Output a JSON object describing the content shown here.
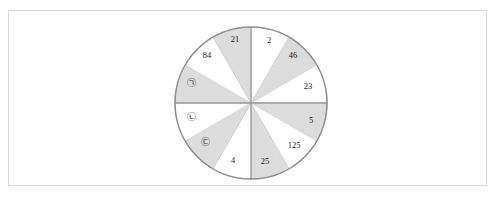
{
  "figure": {
    "type": "circle-sector-diagram",
    "sector_count": 12,
    "sector_angle_degrees": 30,
    "center": {
      "x": 251,
      "y": 103
    },
    "radius": 76,
    "colors": {
      "shaded_fill": "#dcdcdc",
      "white_fill": "#ffffff",
      "outline": "#8e8e8e",
      "axis": "#9a9a9a",
      "frame_border": "#d8d8d8",
      "label_text": "#1c1c1c",
      "background": "#ffffff"
    },
    "axes": [
      {
        "name": "vertical-diameter",
        "orientation": "vertical"
      },
      {
        "name": "horizontal-diameter",
        "orientation": "horizontal"
      }
    ]
  },
  "chart_data": {
    "type": "pie",
    "title": "",
    "xlabel": "",
    "ylabel": "",
    "legend_position": "none",
    "grid": false,
    "note": "Twelve equal 30-degree sectors, alternating white and shaded fill, labelled clockwise from the top.",
    "categories": [
      "2",
      "46",
      "23",
      "5",
      "125",
      "25",
      "4",
      "㉢",
      "㉡",
      "㉠",
      "84",
      "21"
    ],
    "values": [
      30,
      30,
      30,
      30,
      30,
      30,
      30,
      30,
      30,
      30,
      30,
      30
    ],
    "sectors": [
      {
        "index": 0,
        "label": "2",
        "fill": "white",
        "start_deg": 0,
        "end_deg": 30,
        "label_x": 269,
        "label_y": 41,
        "is_marker": false
      },
      {
        "index": 1,
        "label": "46",
        "fill": "shaded",
        "start_deg": 30,
        "end_deg": 60,
        "label_x": 293,
        "label_y": 56,
        "is_marker": false
      },
      {
        "index": 2,
        "label": "23",
        "fill": "white",
        "start_deg": 60,
        "end_deg": 90,
        "label_x": 308,
        "label_y": 87,
        "is_marker": false
      },
      {
        "index": 3,
        "label": "5",
        "fill": "shaded",
        "start_deg": 90,
        "end_deg": 120,
        "label_x": 311,
        "label_y": 121,
        "is_marker": false
      },
      {
        "index": 4,
        "label": "125",
        "fill": "white",
        "start_deg": 120,
        "end_deg": 150,
        "label_x": 294,
        "label_y": 146,
        "is_marker": false
      },
      {
        "index": 5,
        "label": "25",
        "fill": "shaded",
        "start_deg": 150,
        "end_deg": 180,
        "label_x": 265,
        "label_y": 162,
        "is_marker": false
      },
      {
        "index": 6,
        "label": "4",
        "fill": "white",
        "start_deg": 180,
        "end_deg": 210,
        "label_x": 233,
        "label_y": 161,
        "is_marker": false
      },
      {
        "index": 7,
        "label": "㉢",
        "fill": "shaded",
        "start_deg": 210,
        "end_deg": 240,
        "label_x": 205,
        "label_y": 143,
        "is_marker": true
      },
      {
        "index": 8,
        "label": "㉡",
        "fill": "white",
        "start_deg": 240,
        "end_deg": 270,
        "label_x": 191,
        "label_y": 118,
        "is_marker": true
      },
      {
        "index": 9,
        "label": "㉠",
        "fill": "shaded",
        "start_deg": 270,
        "end_deg": 300,
        "label_x": 191,
        "label_y": 84,
        "is_marker": true
      },
      {
        "index": 10,
        "label": "84",
        "fill": "white",
        "start_deg": 300,
        "end_deg": 330,
        "label_x": 207,
        "label_y": 56,
        "is_marker": false
      },
      {
        "index": 11,
        "label": "21",
        "fill": "shaded",
        "start_deg": 330,
        "end_deg": 360,
        "label_x": 235,
        "label_y": 40,
        "is_marker": false
      }
    ]
  }
}
